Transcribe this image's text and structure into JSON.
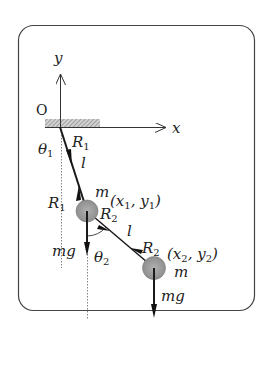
{
  "diagram": {
    "colors": {
      "line": "#1a1a1a",
      "frame": "#444444",
      "mass_fill": "#9a9a9a",
      "hatch": "#8c8c8c",
      "dotted": "#777777"
    },
    "axes": {
      "origin_label": "O",
      "x_label": "x",
      "y_label": "y"
    },
    "angles": {
      "theta1": "θ",
      "theta1_sub": "1",
      "theta2": "θ",
      "theta2_sub": "2"
    },
    "rod_lengths": {
      "upper": "l",
      "lower": "l"
    },
    "forces": {
      "R1_top": {
        "main": "R",
        "sub": "1"
      },
      "R1_mass": {
        "main": "R",
        "sub": "1"
      },
      "R2_mass1": {
        "main": "R",
        "sub": "2"
      },
      "R2_mass2": {
        "main": "R",
        "sub": "2"
      },
      "gravity1": "mg",
      "gravity2": "mg"
    },
    "masses": [
      {
        "label": "m",
        "coord_open": "(x",
        "coord_sub1": "1",
        "coord_mid": ", y",
        "coord_sub2": "1",
        "coord_close": ")"
      },
      {
        "label": "m",
        "coord_open": "(x",
        "coord_sub1": "2",
        "coord_mid": ", y",
        "coord_sub2": "2",
        "coord_close": ")"
      }
    ]
  }
}
